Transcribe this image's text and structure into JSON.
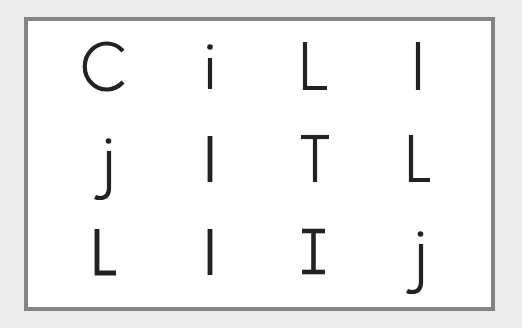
{
  "grid": {
    "rows": 3,
    "cols": 4,
    "cells": [
      [
        "C",
        "i",
        "L",
        "l"
      ],
      [
        "j",
        "l",
        "T",
        "L"
      ],
      [
        "L",
        "l",
        "I",
        "j"
      ]
    ]
  },
  "colors": {
    "background": "#ececec",
    "card": "#ffffff",
    "border": "#858585",
    "glyph": "#222222"
  }
}
